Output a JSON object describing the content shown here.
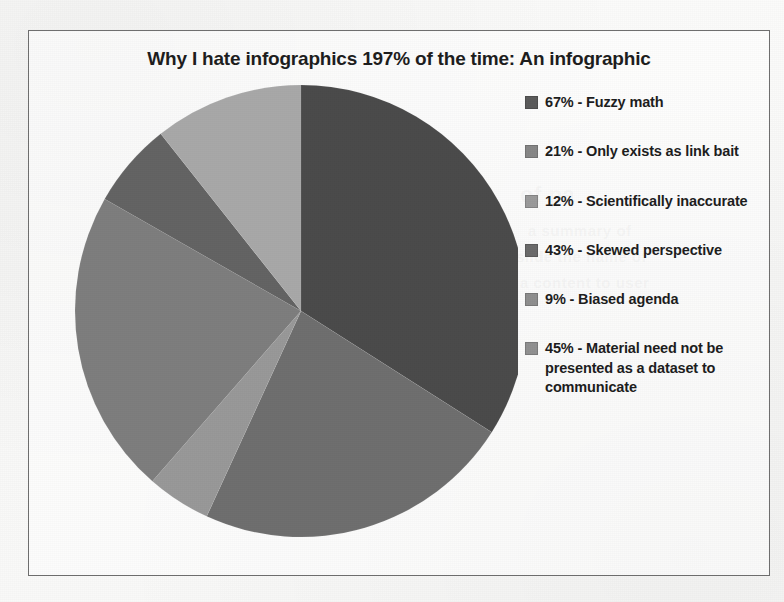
{
  "document": {
    "background_color": "#f8f8f7",
    "frame_border_color": "#6e6e6e"
  },
  "ghost_text": [
    {
      "text": "interfaces",
      "x": 215,
      "y": 182,
      "size": 22
    },
    {
      "text": "of pa",
      "x": 520,
      "y": 182,
      "size": 22
    },
    {
      "text": "a summary of",
      "x": 528,
      "y": 222,
      "size": 15
    },
    {
      "text": "slide the name of",
      "x": 516,
      "y": 248,
      "size": 15
    },
    {
      "text": "a content to user",
      "x": 520,
      "y": 274,
      "size": 15
    },
    {
      "text": "a mission to one the",
      "x": 190,
      "y": 330,
      "size": 15
    },
    {
      "text": "some data sets together takes",
      "x": 185,
      "y": 420,
      "size": 15
    },
    {
      "text": "report to more study",
      "x": 200,
      "y": 452,
      "size": 16
    }
  ],
  "chart_data": {
    "type": "pie",
    "title": "Why I hate infographics 197% of the time: An infographic",
    "total": 197,
    "start_angle_deg": 0,
    "direction": "clockwise",
    "legend_position": "right",
    "grid": false,
    "categories": [
      "Fuzzy math",
      "Only exists as link bait",
      "Scientifically inaccurate",
      "Skewed perspective",
      "Biased agenda",
      "Material need not be presented as a dataset to communicate"
    ],
    "values": [
      67,
      21,
      12,
      43,
      9,
      45
    ],
    "slices": [
      {
        "label": "67% - Fuzzy math",
        "percent_text": "67%",
        "name": "Fuzzy math",
        "value": 67,
        "color": "#4a4a4a",
        "draw_order": 0,
        "sweep_deg": 122.4
      },
      {
        "label": "45% - Material need not be presented as a dataset to communicate",
        "percent_text": "45%",
        "name": "Material need not be presented as a dataset to communicate",
        "value": 45,
        "color": "#6e6e6e",
        "draw_order": 1,
        "sweep_deg": 82.2
      },
      {
        "label": "9% - Biased agenda",
        "percent_text": "9%",
        "name": "Biased agenda",
        "value": 9,
        "color": "#989898",
        "draw_order": 2,
        "sweep_deg": 16.4
      },
      {
        "label": "43% - Skewed perspective",
        "percent_text": "43%",
        "name": "Skewed perspective",
        "value": 43,
        "color": "#7d7d7d",
        "draw_order": 3,
        "sweep_deg": 78.6
      },
      {
        "label": "12%  - Scientifically inaccurate",
        "percent_text": "12%",
        "name": "Scientifically inaccurate",
        "value": 12,
        "color": "#636363",
        "draw_order": 4,
        "sweep_deg": 21.9
      },
      {
        "label": "21% - Only exists as link bait",
        "percent_text": "21%",
        "name": "Only exists as link bait",
        "value": 21,
        "color": "#a8a8a8",
        "draw_order": 5,
        "sweep_deg": 38.4
      }
    ],
    "geometry": {
      "cx": 253,
      "cy": 250,
      "r": 226
    }
  },
  "legend": {
    "items": [
      {
        "label": "67% - Fuzzy math",
        "color": "#5a5a5a"
      },
      {
        "label": "21% - Only exists as link bait",
        "color": "#868686"
      },
      {
        "label": "12%  - Scientifically inaccurate",
        "color": "#9a9a9a"
      },
      {
        "label": "43% - Skewed perspective",
        "color": "#6a6a6a"
      },
      {
        "label": "9% - Biased agenda",
        "color": "#8e8e8e"
      },
      {
        "label": "45% - Material need not be presented as a dataset to communicate",
        "color": "#909090"
      }
    ]
  }
}
